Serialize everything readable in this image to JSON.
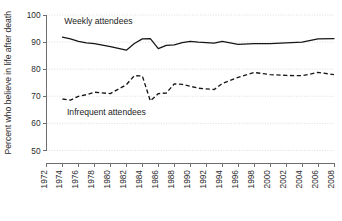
{
  "chart_data": {
    "type": "line",
    "title": "",
    "xlabel": "",
    "ylabel": "Percent who believe in life after death",
    "xlim": [
      1972,
      2008
    ],
    "ylim": [
      50,
      100
    ],
    "yticks": [
      50,
      60,
      70,
      80,
      90,
      100
    ],
    "xticks": [
      1972,
      1974,
      1976,
      1978,
      1980,
      1982,
      1984,
      1986,
      1988,
      1990,
      1992,
      1994,
      1996,
      1998,
      2000,
      2002,
      2004,
      2006,
      2008
    ],
    "grid": true,
    "legend_position": "inline-annotations",
    "annotations": [
      {
        "text": "Weekly attendees",
        "x": 1978.5,
        "y": 96.5
      },
      {
        "text": "Infrequent attendees",
        "x": 1979.5,
        "y": 63.0
      }
    ],
    "series": [
      {
        "name": "Weekly attendees",
        "style": "solid",
        "x": [
          1974,
          1975,
          1976,
          1977,
          1978,
          1980,
          1982,
          1983,
          1984,
          1985,
          1986,
          1987,
          1988,
          1989,
          1990,
          1991,
          1993,
          1994,
          1996,
          1998,
          2000,
          2002,
          2004,
          2006,
          2008
        ],
        "values": [
          91.8,
          91.2,
          90.3,
          89.7,
          89.4,
          88.3,
          87.0,
          89.5,
          91.2,
          91.3,
          87.6,
          88.8,
          89.0,
          89.8,
          90.3,
          90.0,
          89.6,
          90.3,
          89.2,
          89.4,
          89.4,
          89.7,
          90.0,
          91.2,
          91.3
        ]
      },
      {
        "name": "Infrequent attendees",
        "style": "dashed",
        "x": [
          1974,
          1975,
          1976,
          1977,
          1978,
          1980,
          1982,
          1983,
          1984,
          1985,
          1986,
          1987,
          1988,
          1989,
          1990,
          1991,
          1993,
          1994,
          1996,
          1998,
          2000,
          2002,
          2004,
          2006,
          2008
        ],
        "values": [
          69.0,
          68.6,
          70.0,
          70.6,
          71.5,
          71.0,
          74.3,
          77.6,
          77.5,
          68.3,
          71.0,
          71.2,
          74.6,
          74.4,
          73.7,
          73.0,
          72.5,
          74.7,
          77.0,
          78.8,
          78.0,
          77.7,
          77.6,
          78.8,
          78.0
        ]
      }
    ]
  },
  "colors": {
    "series_line": "#161616",
    "grid": "#cfcfcf",
    "axis": "#6e6e6e",
    "text": "#2b2b2b",
    "background": "#ffffff"
  }
}
